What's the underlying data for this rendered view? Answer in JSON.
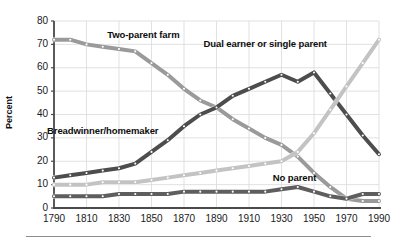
{
  "chart_data": {
    "type": "line",
    "title": "",
    "subtitle": "",
    "xlabel": "",
    "ylabel": "Percent",
    "xlim": [
      1790,
      1990
    ],
    "ylim": [
      0,
      80
    ],
    "yticks": [
      0,
      10,
      20,
      30,
      40,
      50,
      60,
      70,
      80
    ],
    "xticks": [
      1790,
      1810,
      1830,
      1850,
      1870,
      1890,
      1910,
      1930,
      1950,
      1970,
      1990
    ],
    "xtick_labels": [
      "1790",
      "1810",
      "1830",
      "1850",
      "1870",
      "1890",
      "1910",
      "1930",
      "1950",
      "1970",
      "1990"
    ],
    "ytick_labels": [
      "0",
      "10",
      "20",
      "30",
      "40",
      "50",
      "60",
      "70",
      "80"
    ],
    "grid": true,
    "legend_position": "inline-annotations",
    "x": [
      1790,
      1800,
      1810,
      1820,
      1830,
      1840,
      1850,
      1860,
      1870,
      1880,
      1890,
      1900,
      1910,
      1920,
      1930,
      1940,
      1950,
      1960,
      1970,
      1980,
      1990
    ],
    "series": [
      {
        "name": "Two-parent farm",
        "color": "#9a9a9a",
        "values": [
          72,
          72,
          70,
          69,
          68,
          67,
          62,
          57,
          51,
          46,
          43,
          38,
          34,
          30,
          27,
          22,
          15,
          9,
          4,
          3,
          3
        ],
        "annotation": {
          "label": "Two-parent farm",
          "x": 1845,
          "y": 74
        }
      },
      {
        "name": "Breadwinner/homemaker",
        "color": "#4d4d4d",
        "values": [
          13,
          14,
          15,
          16,
          17,
          19,
          24,
          29,
          35,
          40,
          43,
          48,
          51,
          54,
          57,
          54,
          58,
          49,
          40,
          31,
          23
        ],
        "annotation": {
          "label": "Breadwinner/homemaker",
          "x": 1820,
          "y": 33
        }
      },
      {
        "name": "Dual earner or single parent",
        "color": "#c3c3c3",
        "values": [
          10,
          10,
          10,
          11,
          11,
          11,
          12,
          13,
          14,
          15,
          16,
          17,
          18,
          19,
          20,
          24,
          32,
          42,
          52,
          62,
          72
        ],
        "annotation": {
          "label": "Dual earner or single parent",
          "x": 1920,
          "y": 70
        }
      },
      {
        "name": "No parent",
        "color": "#5e5e5e",
        "values": [
          5,
          5,
          5,
          5,
          6,
          6,
          6,
          6,
          7,
          7,
          7,
          7,
          7,
          7,
          8,
          9,
          7,
          5,
          4,
          6,
          6
        ],
        "annotation": {
          "label": "No parent",
          "x": 1938,
          "y": 13
        }
      }
    ]
  }
}
